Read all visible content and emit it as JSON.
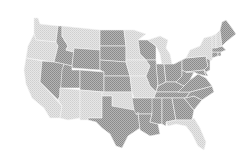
{
  "map": {
    "type": "choropleth",
    "region": "United States (contiguous)",
    "colors": {
      "light": "#dcdcdc",
      "dark": "#9c9c9c",
      "background": "#ffffff"
    },
    "states": [
      {
        "id": "WA",
        "shade": "light"
      },
      {
        "id": "OR",
        "shade": "light"
      },
      {
        "id": "CA",
        "shade": "light"
      },
      {
        "id": "ID",
        "shade": "dark"
      },
      {
        "id": "NV",
        "shade": "dark"
      },
      {
        "id": "MT",
        "shade": "light"
      },
      {
        "id": "WY",
        "shade": "dark"
      },
      {
        "id": "UT",
        "shade": "dark"
      },
      {
        "id": "CO",
        "shade": "dark"
      },
      {
        "id": "AZ",
        "shade": "light"
      },
      {
        "id": "NM",
        "shade": "light"
      },
      {
        "id": "ND",
        "shade": "dark"
      },
      {
        "id": "SD",
        "shade": "dark"
      },
      {
        "id": "NE",
        "shade": "dark"
      },
      {
        "id": "KS",
        "shade": "dark"
      },
      {
        "id": "OK",
        "shade": "light"
      },
      {
        "id": "TX",
        "shade": "dark"
      },
      {
        "id": "MN",
        "shade": "light"
      },
      {
        "id": "IA",
        "shade": "light"
      },
      {
        "id": "MO",
        "shade": "light"
      },
      {
        "id": "AR",
        "shade": "dark"
      },
      {
        "id": "LA",
        "shade": "dark"
      },
      {
        "id": "WI",
        "shade": "dark"
      },
      {
        "id": "IL",
        "shade": "dark"
      },
      {
        "id": "MI",
        "shade": "light"
      },
      {
        "id": "IN",
        "shade": "dark"
      },
      {
        "id": "OH",
        "shade": "dark"
      },
      {
        "id": "KY",
        "shade": "dark"
      },
      {
        "id": "TN",
        "shade": "dark"
      },
      {
        "id": "MS",
        "shade": "dark"
      },
      {
        "id": "AL",
        "shade": "dark"
      },
      {
        "id": "GA",
        "shade": "dark"
      },
      {
        "id": "FL",
        "shade": "light"
      },
      {
        "id": "SC",
        "shade": "dark"
      },
      {
        "id": "NC",
        "shade": "dark"
      },
      {
        "id": "VA",
        "shade": "dark"
      },
      {
        "id": "WV",
        "shade": "dark"
      },
      {
        "id": "PA",
        "shade": "dark"
      },
      {
        "id": "NY",
        "shade": "light"
      },
      {
        "id": "NJ",
        "shade": "dark"
      },
      {
        "id": "MD",
        "shade": "dark"
      },
      {
        "id": "DE",
        "shade": "dark"
      },
      {
        "id": "CT",
        "shade": "dark"
      },
      {
        "id": "RI",
        "shade": "dark"
      },
      {
        "id": "MA",
        "shade": "dark"
      },
      {
        "id": "VT",
        "shade": "light"
      },
      {
        "id": "NH",
        "shade": "light"
      },
      {
        "id": "ME",
        "shade": "dark"
      }
    ]
  }
}
